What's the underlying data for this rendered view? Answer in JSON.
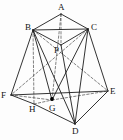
{
  "figure": {
    "type": "line-drawing",
    "canvas": {
      "width": 123,
      "height": 140
    },
    "colors": {
      "background": "#fdfdfd",
      "solid_stroke": "#1c1c1c",
      "hidden_stroke": "#4a4a4a",
      "label_color": "#121212",
      "point_marker": "#000000"
    },
    "vertices": [
      {
        "id": "A",
        "label": "A",
        "x": 61,
        "y": 14,
        "label_x": 58,
        "label_y": 3,
        "visible": true
      },
      {
        "id": "B",
        "label": "B",
        "x": 33,
        "y": 30,
        "label_x": 25,
        "label_y": 23,
        "visible": true
      },
      {
        "id": "C",
        "label": "C",
        "x": 88,
        "y": 29,
        "label_x": 91,
        "label_y": 23,
        "visible": true
      },
      {
        "id": "P",
        "label": "P",
        "x": 61,
        "y": 45,
        "label_x": 54,
        "label_y": 46,
        "visible": true
      },
      {
        "id": "F",
        "label": "F",
        "x": 11,
        "y": 95,
        "label_x": 1,
        "label_y": 91,
        "visible": true
      },
      {
        "id": "E",
        "label": "E",
        "x": 108,
        "y": 91,
        "label_x": 110,
        "label_y": 87,
        "visible": true
      },
      {
        "id": "H",
        "label": "H",
        "x": 34,
        "y": 104,
        "label_x": 29,
        "label_y": 105,
        "visible": true
      },
      {
        "id": "G",
        "label": "G",
        "x": 52,
        "y": 100,
        "label_x": 49,
        "label_y": 104,
        "visible": true
      },
      {
        "id": "D",
        "label": "D",
        "x": 75,
        "y": 124,
        "label_x": 72,
        "label_y": 127,
        "visible": true
      }
    ],
    "point_markers": [
      {
        "at": "G",
        "x": 52,
        "y": 99,
        "r": 1.9
      }
    ],
    "edges_solid": [
      {
        "from": "A",
        "to": "B"
      },
      {
        "from": "A",
        "to": "C"
      },
      {
        "from": "B",
        "to": "C"
      },
      {
        "from": "B",
        "to": "P"
      },
      {
        "from": "C",
        "to": "P"
      },
      {
        "from": "B",
        "to": "F"
      },
      {
        "from": "C",
        "to": "E"
      },
      {
        "from": "B",
        "to": "D"
      },
      {
        "from": "C",
        "to": "D"
      },
      {
        "from": "P",
        "to": "D"
      },
      {
        "from": "F",
        "to": "H"
      },
      {
        "from": "H",
        "to": "D"
      },
      {
        "from": "F",
        "to": "E"
      },
      {
        "from": "E",
        "to": "D"
      },
      {
        "from": "B",
        "to": "G"
      },
      {
        "from": "C",
        "to": "G"
      }
    ],
    "edges_dashed": [
      {
        "from": "A",
        "to": "P"
      },
      {
        "from": "A",
        "to": "G"
      },
      {
        "from": "B",
        "to": "H"
      },
      {
        "from": "F",
        "to": "G"
      },
      {
        "from": "G",
        "to": "E"
      },
      {
        "from": "H",
        "to": "G"
      },
      {
        "from": "B",
        "to": "E"
      },
      {
        "from": "C",
        "to": "F"
      }
    ]
  }
}
